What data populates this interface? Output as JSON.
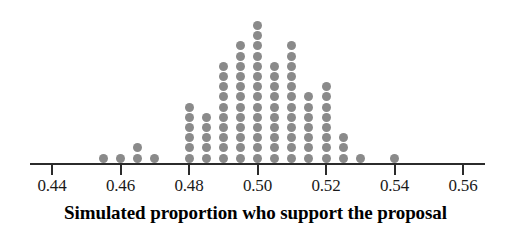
{
  "chart_data": {
    "type": "scatter",
    "plot_style": "dotplot",
    "title": "",
    "xlabel": "Simulated proportion who support the proposal",
    "ylabel": "",
    "xlim": [
      0.435,
      0.565
    ],
    "xtick_labels": [
      "0.44",
      "0.46",
      "0.48",
      "0.50",
      "0.52",
      "0.54",
      "0.56"
    ],
    "xticks": [
      0.44,
      0.46,
      0.48,
      0.5,
      0.52,
      0.54,
      0.56
    ],
    "grid": false,
    "legend": "none",
    "dot_color": "#8a8a8a",
    "axis_color": "#2b2b2b",
    "bin_width": 0.005,
    "x": [
      0.455,
      0.46,
      0.465,
      0.47,
      0.48,
      0.485,
      0.49,
      0.495,
      0.5,
      0.505,
      0.51,
      0.515,
      0.52,
      0.525,
      0.53,
      0.54
    ],
    "counts": [
      1,
      1,
      2,
      1,
      6,
      5,
      10,
      12,
      14,
      10,
      12,
      7,
      8,
      3,
      1,
      1
    ],
    "total_dots": 94
  },
  "axis": {
    "title": "Simulated proportion who support the proposal"
  }
}
